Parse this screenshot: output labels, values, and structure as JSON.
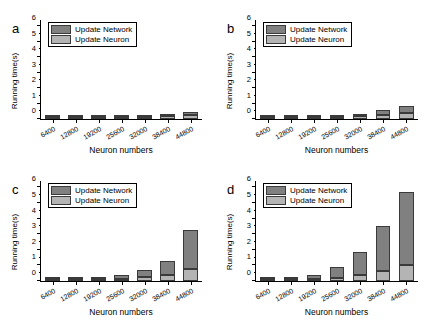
{
  "figure": {
    "panels": [
      "a",
      "b",
      "c",
      "d"
    ]
  },
  "legend": {
    "network_label": "Update Network",
    "neuron_label": "Update Neuron",
    "network_color": "#808080",
    "neuron_color": "#b4b4b4"
  },
  "axes": {
    "xlabel": "Neuron numbers",
    "ylabel": "Running time(s)",
    "ytick_labels": [
      "0",
      "1",
      "2",
      "3",
      "4",
      "5",
      "6"
    ],
    "xtick_labels": [
      "6400",
      "12800",
      "19200",
      "25600",
      "32000",
      "38400",
      "44800"
    ]
  },
  "chart_data": [
    {
      "type": "bar",
      "panel": "a",
      "title": "",
      "xlabel": "Neuron numbers",
      "ylabel": "Running time(s)",
      "categories": [
        "6400",
        "12800",
        "19200",
        "25600",
        "32000",
        "38400",
        "44800"
      ],
      "ylim": [
        0,
        6.4
      ],
      "yticks": [
        0,
        1,
        2,
        3,
        4,
        5,
        6
      ],
      "grid": false,
      "legend_position": "upper-left",
      "stacked": true,
      "series": [
        {
          "name": "Update Neuron",
          "values": [
            0.12,
            0.3,
            0.45,
            0.6,
            0.72,
            0.88,
            1.05
          ]
        },
        {
          "name": "Update Network",
          "values": [
            0.08,
            0.1,
            0.15,
            0.25,
            0.38,
            0.52,
            0.63
          ]
        }
      ],
      "totals": [
        0.2,
        0.4,
        0.6,
        0.85,
        1.1,
        1.4,
        1.68
      ]
    },
    {
      "type": "bar",
      "panel": "b",
      "title": "",
      "xlabel": "Neuron numbers",
      "ylabel": "Running time(s)",
      "categories": [
        "6400",
        "12800",
        "19200",
        "25600",
        "32000",
        "38400",
        "44800"
      ],
      "ylim": [
        0,
        6.4
      ],
      "yticks": [
        0,
        1,
        2,
        3,
        4,
        5,
        6
      ],
      "grid": false,
      "legend_position": "upper-left",
      "stacked": true,
      "series": [
        {
          "name": "Update Neuron",
          "values": [
            0.12,
            0.3,
            0.45,
            0.58,
            0.72,
            0.88,
            1.05
          ]
        },
        {
          "name": "Update Network",
          "values": [
            0.08,
            0.13,
            0.29,
            0.48,
            0.73,
            1.0,
            1.25
          ]
        }
      ],
      "totals": [
        0.2,
        0.43,
        0.74,
        1.06,
        1.45,
        1.88,
        2.3
      ]
    },
    {
      "type": "bar",
      "panel": "c",
      "title": "",
      "xlabel": "Neuron numbers",
      "ylabel": "Running time(s)",
      "categories": [
        "6400",
        "12800",
        "19200",
        "25600",
        "32000",
        "38400",
        "44800"
      ],
      "ylim": [
        0,
        6.4
      ],
      "yticks": [
        0,
        1,
        2,
        3,
        4,
        5,
        6
      ],
      "grid": false,
      "legend_position": "upper-left",
      "stacked": true,
      "series": [
        {
          "name": "Update Neuron",
          "values": [
            0.14,
            0.31,
            0.45,
            0.57,
            0.74,
            0.89,
            1.05
          ]
        },
        {
          "name": "Update Network",
          "values": [
            0.09,
            0.26,
            0.57,
            0.95,
            1.38,
            1.98,
            3.5
          ]
        }
      ],
      "totals": [
        0.23,
        0.57,
        1.02,
        1.52,
        2.12,
        2.87,
        4.55
      ]
    },
    {
      "type": "bar",
      "panel": "d",
      "title": "",
      "xlabel": "Neuron numbers",
      "ylabel": "Running time(s)",
      "categories": [
        "6400",
        "12800",
        "19200",
        "25600",
        "32000",
        "38400",
        "44800"
      ],
      "ylim": [
        0,
        6.4
      ],
      "yticks": [
        0,
        1,
        2,
        3,
        4,
        5,
        6
      ],
      "grid": false,
      "legend_position": "upper-left",
      "stacked": true,
      "series": [
        {
          "name": "Update Neuron",
          "values": [
            0.2,
            0.3,
            0.45,
            0.58,
            0.75,
            0.9,
            1.07
          ]
        },
        {
          "name": "Update Network",
          "values": [
            0.13,
            0.55,
            1.11,
            1.84,
            2.67,
            3.86,
            4.96
          ]
        }
      ],
      "totals": [
        0.33,
        0.85,
        1.56,
        2.42,
        3.42,
        4.76,
        6.03
      ]
    }
  ]
}
